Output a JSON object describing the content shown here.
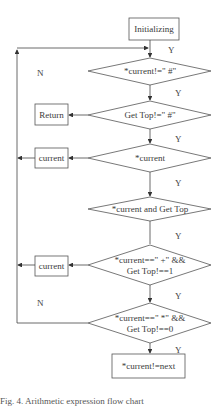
{
  "nodes": {
    "start": "Initializing",
    "d1": "*current!=\" #\"",
    "d2": "Get Top!=\" #\"",
    "ret": "Return",
    "d3": "*current",
    "cur1": "current",
    "d4": "*current and Get Top",
    "d5_line1": "*current==\" +\" &&",
    "d5_line2": "Get Top!==1",
    "cur2": "current",
    "d6_line1": "*current==\" *\" &&",
    "d6_line2": "Get Top!==0",
    "end": "*current!=next"
  },
  "edge_labels": {
    "y1": "Y",
    "y2": "Y",
    "y3": "Y",
    "y4": "Y",
    "y5": "Y",
    "y6": "Y",
    "n1": "N",
    "n2": "N"
  },
  "caption": "Fig. 4. Arithmetic expression flow chart"
}
